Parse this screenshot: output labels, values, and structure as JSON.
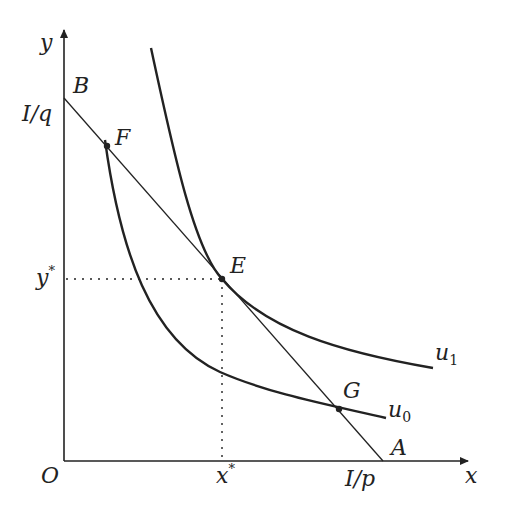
{
  "diagram": {
    "type": "consumer-choice-indifference-curves",
    "axes": {
      "x_label": "x",
      "y_label": "y",
      "origin_label": "O"
    },
    "budget_line": {
      "y_intercept_label": "I/q",
      "x_intercept_label": "I/p",
      "endpoint_top_label": "B",
      "endpoint_bottom_label": "A"
    },
    "curves": [
      {
        "name": "u1",
        "label": "u",
        "subscript": "1"
      },
      {
        "name": "u0",
        "label": "u",
        "subscript": "0"
      }
    ],
    "points": [
      {
        "name": "F",
        "label": "F"
      },
      {
        "name": "E",
        "label": "E"
      },
      {
        "name": "G",
        "label": "G"
      }
    ],
    "optimum": {
      "x_label": "x*",
      "y_label": "y*",
      "x_base": "x",
      "y_base": "y",
      "star": "*"
    },
    "colors": {
      "line": "#222222",
      "background": "#ffffff"
    }
  }
}
